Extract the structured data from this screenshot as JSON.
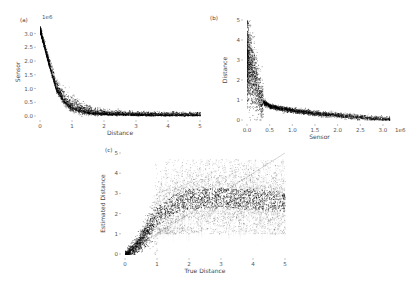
{
  "chart_data": [
    {
      "panel": "(a)",
      "type": "scatter",
      "xlabel": "Distance",
      "ylabel": "Sensor",
      "y_offset_label": "1e6",
      "xlim": [
        0,
        5
      ],
      "ylim": [
        0,
        3.2
      ],
      "xticks": [
        "0",
        "1",
        "2",
        "3",
        "4",
        "5"
      ],
      "yticks": [
        "0.0",
        "0.5",
        "1.0",
        "1.5",
        "2.0",
        "2.5",
        "3.0"
      ],
      "grid": false,
      "trend": {
        "x": [
          0,
          0.25,
          0.5,
          0.75,
          1.0,
          1.5,
          2,
          3,
          4,
          5
        ],
        "y": [
          3.1,
          2.0,
          1.0,
          0.55,
          0.32,
          0.15,
          0.09,
          0.06,
          0.05,
          0.05
        ]
      }
    },
    {
      "panel": "(b)",
      "type": "scatter",
      "xlabel": "Sensor",
      "ylabel": "Distance",
      "x_offset_label": "1e6",
      "xlim": [
        0,
        3.2
      ],
      "ylim": [
        0,
        5
      ],
      "xticks": [
        "0.0",
        "0.5",
        "1.0",
        "1.5",
        "2.0",
        "2.5",
        "3.0"
      ],
      "yticks": [
        "0",
        "1",
        "2",
        "3",
        "4",
        "5"
      ],
      "grid": false,
      "trend": {
        "x": [
          0.02,
          0.1,
          0.2,
          0.3,
          0.5,
          1.0,
          1.5,
          2.0,
          2.5,
          3.1
        ],
        "y": [
          3.0,
          2.5,
          1.8,
          1.0,
          0.7,
          0.5,
          0.35,
          0.25,
          0.15,
          0.05
        ]
      }
    },
    {
      "panel": "(c)",
      "type": "scatter",
      "xlabel": "True Distance",
      "ylabel": "Estimated Distance",
      "xlim": [
        0,
        5
      ],
      "ylim": [
        0,
        5
      ],
      "xticks": [
        "0",
        "1",
        "2",
        "3",
        "4",
        "5"
      ],
      "yticks": [
        "0",
        "1",
        "2",
        "3",
        "4",
        "5"
      ],
      "grid": false,
      "reference_line": {
        "x": [
          0,
          5
        ],
        "y": [
          0,
          5
        ]
      },
      "trend": {
        "x": [
          0,
          0.25,
          0.5,
          0.75,
          1.0,
          1.5,
          2,
          3,
          4,
          5
        ],
        "y": [
          0,
          0.3,
          0.7,
          1.3,
          1.9,
          2.5,
          2.7,
          2.8,
          2.7,
          2.6
        ]
      }
    }
  ]
}
